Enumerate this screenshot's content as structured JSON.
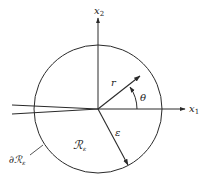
{
  "diagram": {
    "type": "polar-coordinate-figure",
    "colors": {
      "ink": "#2a2a2a",
      "background": "#ffffff"
    },
    "axes": {
      "x1": {
        "label": "x",
        "subscript": "1"
      },
      "x2": {
        "label": "x",
        "subscript": "2"
      }
    },
    "labels": {
      "r": "r",
      "theta": "θ",
      "epsilon": "ε",
      "region": {
        "symbol": "ℛ",
        "subscript": "ε"
      },
      "boundary": {
        "prefix": "∂",
        "symbol": "ℛ",
        "subscript": "ε"
      }
    },
    "geometry": {
      "center": [
        98,
        109
      ],
      "radius": 64,
      "r_vector_angle_deg": 38,
      "epsilon_vector_angle_deg": -62,
      "crack": "thin wedge extending from origin toward negative x1"
    }
  }
}
